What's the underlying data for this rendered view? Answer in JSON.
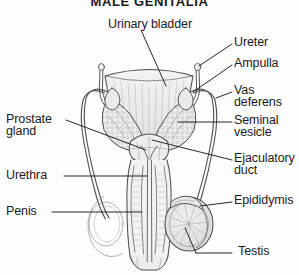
{
  "figure": {
    "title": "MALE GENITALIA",
    "title_clipped": true,
    "background_color": "#fdfdfd",
    "ink_color": "#1b1b1b",
    "line_color": "#555555",
    "width": 299,
    "height": 275
  },
  "labels": {
    "urinary_bladder": "Urinary bladder",
    "ureter": "Ureter",
    "ampulla": "Ampulla",
    "vas_deferens_1": "Vas",
    "vas_deferens_2": "deferens",
    "seminal_vesicle_1": "Seminal",
    "seminal_vesicle_2": "vesicle",
    "ejaculatory_duct_1": "Ejaculatory",
    "ejaculatory_duct_2": "duct",
    "epididymis": "Epididymis",
    "testis": "Testis",
    "prostate_gland_1": "Prostate",
    "prostate_gland_2": "gland",
    "urethra": "Urethra",
    "penis": "Penis"
  },
  "anatomy_parts": [
    "urinary-bladder",
    "ureter",
    "ampulla",
    "vas-deferens",
    "seminal-vesicle",
    "ejaculatory-duct",
    "epididymis",
    "testis",
    "prostate-gland",
    "urethra",
    "penis"
  ]
}
